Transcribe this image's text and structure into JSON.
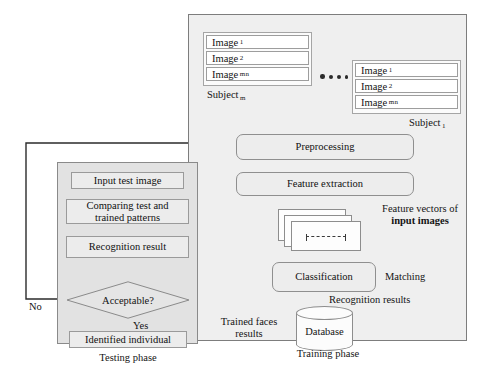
{
  "diagram": {
    "colors": {
      "training_panel_bg": "#efefef",
      "testing_panel_bg": "#e2e2e2",
      "node_bg": "#ececec",
      "stroke": "#3a3a3a",
      "page_bg": "#ffffff"
    }
  },
  "training": {
    "caption": "Training phase",
    "subject_m": {
      "label": "Subject",
      "label_sub": "m",
      "images": [
        {
          "text": "Image",
          "sub": "1"
        },
        {
          "text": "Image",
          "sub": "2"
        },
        {
          "text": "Image",
          "sub": "mn"
        }
      ]
    },
    "subject_1": {
      "label": "Subject",
      "label_sub": "1",
      "images": [
        {
          "text": "Image",
          "sub": "1"
        },
        {
          "text": "Image",
          "sub": "2"
        },
        {
          "text": "Image",
          "sub": "mn"
        }
      ]
    },
    "ellipsis_dots": 4,
    "preprocessing": "Preprocessing",
    "feature_extraction": "Feature extraction",
    "feature_vectors_label_line1": "Feature vectors of",
    "feature_vectors_label_line2": "input images",
    "classification": "Classification",
    "matching": "Matching",
    "recognition_results": "Recognition results",
    "database": "Database",
    "trained_faces_line1": "Trained faces",
    "trained_faces_line2": "results"
  },
  "testing": {
    "caption": "Testing phase",
    "input_test_image": "Input test image",
    "comparing_line1": "Comparing test and",
    "comparing_line2": "trained patterns",
    "recognition_result": "Recognition result",
    "acceptable": "Acceptable?",
    "branch_yes": "Yes",
    "branch_no": "No",
    "identified_individual": "Identified individual"
  }
}
